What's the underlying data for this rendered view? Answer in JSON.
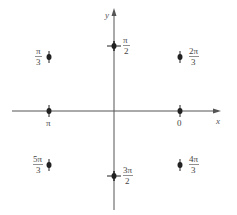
{
  "diagram": {
    "axes": {
      "x_label": "x",
      "y_label": "y",
      "color": "#555555"
    },
    "points": [
      {
        "id": "pi-over-2",
        "num": "π",
        "den": "2",
        "x": 114,
        "y": 46,
        "label_side": "right"
      },
      {
        "id": "pi-over-3",
        "num": "π",
        "den": "3",
        "x": 49,
        "y": 57,
        "label_side": "left"
      },
      {
        "id": "2pi-over-3",
        "num": "2π",
        "den": "3",
        "x": 180,
        "y": 57,
        "label_side": "right"
      },
      {
        "id": "pi",
        "text": "π",
        "x": 49,
        "y": 111,
        "label_side": "below"
      },
      {
        "id": "zero",
        "text": "0",
        "x": 180,
        "y": 111,
        "label_side": "below"
      },
      {
        "id": "5pi-over-3",
        "num": "5π",
        "den": "3",
        "x": 49,
        "y": 165,
        "label_side": "left"
      },
      {
        "id": "3pi-over-2",
        "num": "3π",
        "den": "2",
        "x": 114,
        "y": 176,
        "label_side": "right"
      },
      {
        "id": "4pi-over-3",
        "num": "4π",
        "den": "3",
        "x": 180,
        "y": 165,
        "label_side": "right"
      }
    ]
  }
}
